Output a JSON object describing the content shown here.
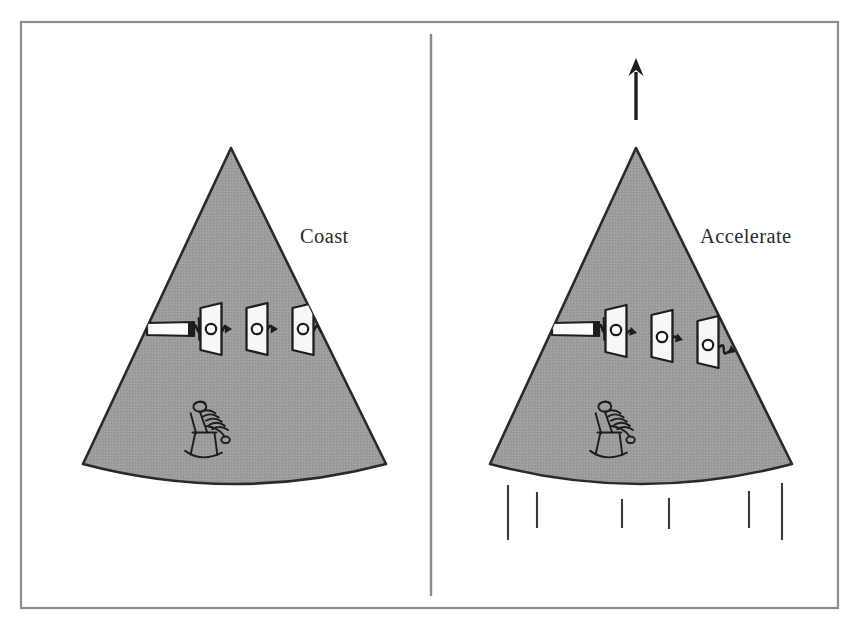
{
  "figure": {
    "background_color": "#ffffff",
    "frame": {
      "name": "outer-border",
      "stroke_color": "#8d8d8d",
      "x": 21,
      "y": 22,
      "width": 817,
      "height": 586
    },
    "divider": {
      "name": "center-divider",
      "stroke_color": "#8a8a8a",
      "x": 431,
      "y_top": 34,
      "y_bottom": 596
    },
    "palette": {
      "rocket_fill": "#9d9d9d",
      "rocket_stroke": "#2a2a2a",
      "ink": "#1d1d1d",
      "screen_fill": "#f7f7f5",
      "label_color": "#2b2b2b",
      "frame_color": "#8d8d8d",
      "exhaust_color": "#3a3a3a"
    }
  },
  "panels": [
    {
      "id": "left",
      "label": "Coast",
      "label_x": 300,
      "label_y": 243,
      "has_arrow": false,
      "has_exhaust": false,
      "beam_bends": false,
      "description": "Rocket coasting at constant velocity; light travels in a straight line through the three apertures.",
      "rocket": {
        "apex_x": 231,
        "apex_y": 148,
        "base_left_x": 83,
        "base_left_y": 464,
        "base_right_x": 386,
        "base_right_y": 464,
        "base_sag": 20
      },
      "flashlight": {
        "x": 147,
        "y": 322,
        "width": 47,
        "height": 14
      },
      "screens": [
        {
          "x": 212,
          "y_center": 329,
          "hole_y": 329
        },
        {
          "x": 258,
          "y_center": 329,
          "hole_y": 329
        },
        {
          "x": 304,
          "y_center": 329,
          "hole_y": 329
        }
      ],
      "beam_points": [
        {
          "x": 200,
          "y": 329
        },
        {
          "x": 244,
          "y": 329
        },
        {
          "x": 290,
          "y": 329
        },
        {
          "x": 340,
          "y": 329
        }
      ],
      "person": {
        "x": 198,
        "y": 438,
        "label": "seated-observer"
      }
    },
    {
      "id": "right",
      "label": "Accelerate",
      "label_x": 700,
      "label_y": 243,
      "has_arrow": true,
      "has_exhaust": true,
      "beam_bends": true,
      "description": "Rocket accelerating upward; the light path curves downward relative to the cabin.",
      "arrow": {
        "x": 636,
        "y_tail": 120,
        "y_head": 58,
        "head_width": 15,
        "head_height": 18
      },
      "rocket": {
        "apex_x": 636,
        "apex_y": 148,
        "base_left_x": 490,
        "base_left_y": 464,
        "base_right_x": 792,
        "base_right_y": 464,
        "base_sag": 20
      },
      "flashlight": {
        "x": 552,
        "y": 322,
        "width": 47,
        "height": 14
      },
      "screens": [
        {
          "x": 617,
          "y_center": 331,
          "hole_y": 330
        },
        {
          "x": 663,
          "y_center": 336,
          "hole_y": 337
        },
        {
          "x": 709,
          "y_center": 342,
          "hole_y": 345
        }
      ],
      "beam_points": [
        {
          "x": 605,
          "y": 328
        },
        {
          "x": 649,
          "y": 333
        },
        {
          "x": 695,
          "y": 340
        },
        {
          "x": 748,
          "y": 352
        }
      ],
      "person": {
        "x": 603,
        "y": 438,
        "label": "seated-observer"
      },
      "exhaust_lines": [
        {
          "x": 508,
          "y_top": 485,
          "y_bottom": 540
        },
        {
          "x": 537,
          "y_top": 492,
          "y_bottom": 528
        },
        {
          "x": 622,
          "y_top": 499,
          "y_bottom": 528
        },
        {
          "x": 669,
          "y_top": 498,
          "y_bottom": 529
        },
        {
          "x": 749,
          "y_top": 491,
          "y_bottom": 528
        },
        {
          "x": 782,
          "y_top": 483,
          "y_bottom": 540
        }
      ]
    }
  ]
}
